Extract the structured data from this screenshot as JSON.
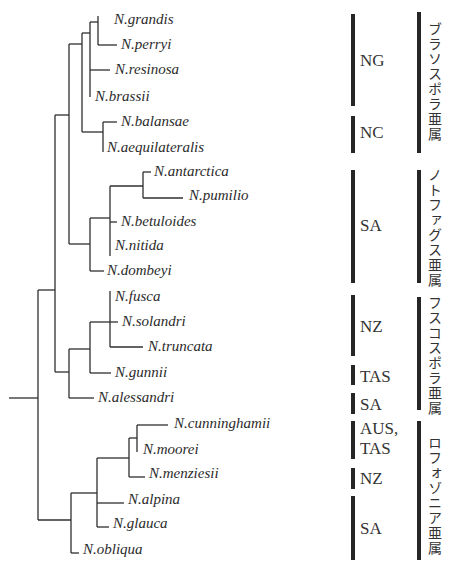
{
  "figure": {
    "type": "phylogenetic_tree",
    "genus": "Nothofagus"
  },
  "leaves": [
    {
      "name": "N.grandis",
      "x": 114,
      "y": 20
    },
    {
      "name": "N.perryi",
      "x": 121,
      "y": 45
    },
    {
      "name": "N.resinosa",
      "x": 115,
      "y": 70
    },
    {
      "name": "N.brassii",
      "x": 95,
      "y": 97
    },
    {
      "name": "N.balansae",
      "x": 121,
      "y": 122
    },
    {
      "name": "N.aequilateralis",
      "x": 107,
      "y": 148
    },
    {
      "name": "N.antarctica",
      "x": 154,
      "y": 172
    },
    {
      "name": "N.pumilio",
      "x": 189,
      "y": 196
    },
    {
      "name": "N.betuloides",
      "x": 121,
      "y": 222
    },
    {
      "name": "N.nitida",
      "x": 115,
      "y": 246
    },
    {
      "name": "N.dombeyi",
      "x": 107,
      "y": 271
    },
    {
      "name": "N.fusca",
      "x": 115,
      "y": 297
    },
    {
      "name": "N.solandri",
      "x": 122,
      "y": 322
    },
    {
      "name": "N.truncata",
      "x": 148,
      "y": 347
    },
    {
      "name": "N.gunnii",
      "x": 115,
      "y": 373
    },
    {
      "name": "N.alessandri",
      "x": 98,
      "y": 398
    },
    {
      "name": "N.cunninghamii",
      "x": 174,
      "y": 424
    },
    {
      "name": "N.moorei",
      "x": 143,
      "y": 450
    },
    {
      "name": "N.menziesii",
      "x": 149,
      "y": 474
    },
    {
      "name": "N.alpina",
      "x": 128,
      "y": 500
    },
    {
      "name": "N.glauca",
      "x": 113,
      "y": 524
    },
    {
      "name": "N.obliqua",
      "x": 83,
      "y": 550
    }
  ],
  "regions": [
    {
      "label": "NG",
      "bar_top": 14,
      "bar_bottom": 106,
      "label_y": 52
    },
    {
      "label": "NC",
      "bar_top": 116,
      "bar_bottom": 153,
      "label_y": 124
    },
    {
      "label": "SA",
      "bar_top": 170,
      "bar_bottom": 283,
      "label_y": 217
    },
    {
      "label": "NZ",
      "bar_top": 295,
      "bar_bottom": 356,
      "label_y": 318
    },
    {
      "label": "TAS",
      "bar_top": 365,
      "bar_bottom": 385,
      "label_y": 368
    },
    {
      "label": "SA",
      "bar_top": 393,
      "bar_bottom": 414,
      "label_y": 396
    },
    {
      "label": "AUS,",
      "label2": "TAS",
      "bar_top": 421,
      "bar_bottom": 459,
      "label_y": 419
    },
    {
      "label": "NZ",
      "bar_top": 468,
      "bar_bottom": 489,
      "label_y": 470
    },
    {
      "label": "SA",
      "bar_top": 496,
      "bar_bottom": 560,
      "label_y": 520
    }
  ],
  "subgenera": [
    {
      "label": "ブラソスポラ亜属",
      "bar_top": 12,
      "bar_bottom": 153,
      "label_top": 22
    },
    {
      "label": "ノトファグス亜属",
      "bar_top": 170,
      "bar_bottom": 283,
      "label_top": 170
    },
    {
      "label": "フスコスポラ亜属",
      "bar_top": 297,
      "bar_bottom": 410,
      "label_top": 296
    },
    {
      "label": "ロフォゾニア亜属",
      "bar_top": 421,
      "bar_bottom": 560,
      "label_top": 436
    }
  ]
}
